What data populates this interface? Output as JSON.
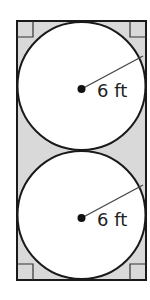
{
  "diagram": {
    "colors": {
      "shaded_region": "#d9d9d9",
      "circle_fill": "#ffffff",
      "stroke": "#1a1a1a"
    },
    "rectangle": {
      "x": 17,
      "y": 21,
      "width": 129,
      "height": 259
    },
    "circles": [
      {
        "cx": 81.5,
        "cy": 86,
        "r": 64,
        "radius_label": "6 ft",
        "radius_end": [
          143,
          56
        ]
      },
      {
        "cx": 81.5,
        "cy": 215,
        "r": 64,
        "radius_label": "6 ft",
        "radius_end": [
          143,
          185
        ]
      }
    ],
    "right_angle_markers": [
      "top-left",
      "top-right",
      "bottom-left",
      "bottom-right"
    ]
  }
}
